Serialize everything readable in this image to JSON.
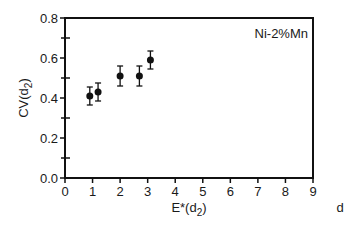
{
  "chart_data": {
    "type": "scatter",
    "title": "",
    "annotation": "Ni-2%Mn",
    "xlabel": "E*(d2)",
    "xlabel_main": "E*(d",
    "xlabel_sub": "2",
    "xlabel_close": ")",
    "ylabel_main": "CV(d",
    "ylabel_sub": "2",
    "ylabel_close": ")",
    "ylabel": "CV(d2)",
    "trailing_label": "d",
    "xlim": [
      0,
      9
    ],
    "ylim": [
      0.0,
      0.8
    ],
    "xticks": [
      "0",
      "1",
      "2",
      "3",
      "4",
      "5",
      "6",
      "7",
      "8",
      "9"
    ],
    "yticks": [
      "0.0",
      "0.2",
      "0.4",
      "0.6",
      "0.8"
    ],
    "grid": false,
    "legend": null,
    "series": [
      {
        "name": "Ni-2%Mn",
        "marker": "filled-circle",
        "x": [
          0.9,
          1.2,
          2.0,
          2.7,
          3.1
        ],
        "y": [
          0.41,
          0.43,
          0.51,
          0.51,
          0.59
        ],
        "yerr": [
          0.045,
          0.045,
          0.05,
          0.05,
          0.045
        ]
      }
    ]
  },
  "layout": {
    "plot_left": 65,
    "plot_right": 313,
    "plot_top": 18,
    "plot_bottom": 178,
    "colors": {
      "axis": "#111111",
      "marker": "#111111",
      "background": "#ffffff"
    }
  }
}
